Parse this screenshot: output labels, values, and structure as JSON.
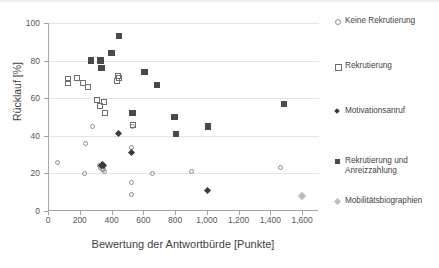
{
  "chart_data": {
    "type": "scatter",
    "title": "",
    "xlabel": "Bewertung der Antwortbürde [Punkte]",
    "ylabel": "Rücklauf [%]",
    "xlim": [
      0,
      1700
    ],
    "ylim": [
      0,
      100
    ],
    "xticks": [
      0,
      200,
      400,
      600,
      800,
      1000,
      1200,
      1400,
      1600
    ],
    "xtick_labels": [
      "0",
      "200",
      "400",
      "600",
      "800",
      "1,000",
      "1,200",
      "1,400",
      "1,600"
    ],
    "yticks": [
      0,
      20,
      40,
      60,
      80,
      100
    ],
    "ytick_labels": [
      "0",
      "20",
      "40",
      "60",
      "80",
      "100"
    ],
    "grid": "horizontal",
    "legend_position": "right",
    "series": [
      {
        "name": "Keine Rekrutierung",
        "marker": "circle-open",
        "color": "#8c8c8c",
        "points": [
          [
            55,
            26
          ],
          [
            225,
            20
          ],
          [
            230,
            36
          ],
          [
            275,
            45
          ],
          [
            315,
            24
          ],
          [
            322,
            23
          ],
          [
            330,
            24
          ],
          [
            336,
            22
          ],
          [
            343,
            22
          ],
          [
            350,
            21
          ],
          [
            520,
            34
          ],
          [
            520,
            15
          ],
          [
            518,
            9
          ],
          [
            525,
            45
          ],
          [
            650,
            20
          ],
          [
            900,
            21
          ],
          [
            1460,
            23
          ]
        ]
      },
      {
        "name": "Rekrutierung",
        "marker": "square-open",
        "color": "#6f6f6f",
        "points": [
          [
            120,
            68
          ],
          [
            122,
            70
          ],
          [
            175,
            71
          ],
          [
            215,
            68
          ],
          [
            245,
            66
          ],
          [
            300,
            59
          ],
          [
            318,
            56
          ],
          [
            345,
            58
          ],
          [
            352,
            52
          ],
          [
            430,
            69
          ],
          [
            437,
            72
          ],
          [
            443,
            71
          ],
          [
            530,
            46
          ]
        ]
      },
      {
        "name": "Motivationsanruf",
        "marker": "diamond-fill",
        "color": "#3a3a3a",
        "points": [
          [
            330,
            24
          ],
          [
            335,
            25
          ],
          [
            340,
            24
          ],
          [
            435,
            41
          ],
          [
            520,
            31
          ],
          [
            1000,
            11
          ]
        ]
      },
      {
        "name": "Rekrutierung und Anreizzahlung",
        "marker": "square-fill",
        "color": "#4a4a4a",
        "points": [
          [
            265,
            80
          ],
          [
            325,
            80
          ],
          [
            330,
            76
          ],
          [
            395,
            84
          ],
          [
            440,
            93
          ],
          [
            525,
            52
          ],
          [
            600,
            74
          ],
          [
            680,
            67
          ],
          [
            790,
            50
          ],
          [
            800,
            41
          ],
          [
            1000,
            45
          ],
          [
            1480,
            57
          ]
        ]
      },
      {
        "name": "Mobilitätsbiographien",
        "marker": "diamond-light",
        "color": "#bdbdbd",
        "points": [
          [
            1590,
            8
          ]
        ]
      }
    ]
  },
  "axes": {
    "y_title": "Rücklauf [%]",
    "x_title": "Bewertung der Antwortbürde [Punkte]"
  },
  "legend": {
    "items": [
      {
        "label": "Keine Rekrutierung",
        "marker": "circle-open-icon"
      },
      {
        "label": "Rekrutierung",
        "marker": "square-open-icon"
      },
      {
        "label": "Motivationsanruf",
        "marker": "diamond-filled-icon"
      },
      {
        "label": "Rekrutierung und",
        "label2": "Anreizzahlung",
        "marker": "square-filled-icon"
      },
      {
        "label": "Mobilitätsbiographien",
        "marker": "diamond-light-icon"
      }
    ]
  }
}
